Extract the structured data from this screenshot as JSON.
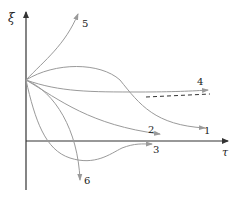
{
  "diagram": {
    "axes": {
      "y_label": "ξ",
      "x_label": "τ"
    },
    "curves": [
      {
        "id": "1",
        "label": "1",
        "description": "rises then decays to horizontal asymptote above axis"
      },
      {
        "id": "2",
        "label": "2",
        "description": "monotone decay approaching slightly above axis"
      },
      {
        "id": "3",
        "label": "3",
        "description": "dips below axis then rises back toward axis"
      },
      {
        "id": "4",
        "label": "4",
        "description": "approaches dashed horizontal asymptote"
      },
      {
        "id": "5",
        "label": "5",
        "description": "grows upward unbounded"
      },
      {
        "id": "6",
        "label": "6",
        "description": "falls downward unbounded"
      }
    ],
    "asymptote_style": "dashed",
    "colors": {
      "axis": "#333333",
      "curve": "#9a9a9a",
      "label": "#222222"
    }
  }
}
